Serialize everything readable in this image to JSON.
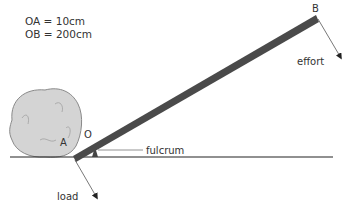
{
  "equations": {
    "oa": "OA = 10cm",
    "ob": "OB = 200cm"
  },
  "labels": {
    "point_b": "B",
    "point_a": "A",
    "point_o": "O",
    "effort": "effort",
    "fulcrum": "fulcrum",
    "load": "load"
  },
  "colors": {
    "lever": "#4a4a4a",
    "rock_fill": "#d4d4d4",
    "rock_stroke": "#8a8a8a",
    "ground": "#222222",
    "arrow": "#555555"
  }
}
